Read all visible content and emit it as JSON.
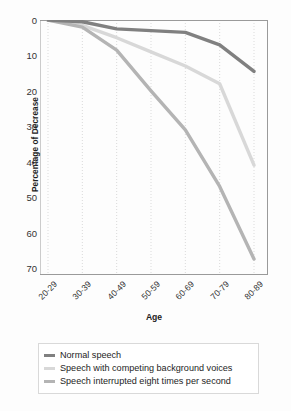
{
  "chart_data": {
    "type": "line",
    "title": "",
    "xlabel": "Age",
    "ylabel": "Percentage of Decrease",
    "categories": [
      "20-29",
      "30-39",
      "40-49",
      "50-59",
      "60-69",
      "70-79",
      "80-89"
    ],
    "ylim": [
      0,
      72
    ],
    "y_inverted": true,
    "yticks": [
      0,
      10,
      20,
      30,
      40,
      50,
      60,
      70
    ],
    "grid": "vertical-dotted",
    "legend_position": "below-axes",
    "series": [
      {
        "name": "Normal speech",
        "color": "#808080",
        "values": [
          0,
          0.5,
          2.5,
          3.0,
          3.5,
          7.0,
          14.5
        ]
      },
      {
        "name": "Speech with competing background voices",
        "color": "#d8d8d8",
        "values": [
          0,
          1.5,
          5.0,
          9.0,
          13.0,
          18.0,
          41.0
        ]
      },
      {
        "name": "Speech interrupted eight times per second",
        "color": "#b4b4b4",
        "values": [
          0,
          2.0,
          8.5,
          20.0,
          31.0,
          47.0,
          67.5
        ]
      }
    ]
  },
  "axes": {
    "ylabel": "Percentage of Decrease",
    "xlabel": "Age",
    "ytick_labels": [
      "0",
      "10",
      "20",
      "30",
      "40",
      "50",
      "60",
      "70"
    ],
    "xtick_labels": [
      "20-29",
      "30-39",
      "40-49",
      "50-59",
      "60-69",
      "70-79",
      "80-89"
    ]
  },
  "legend": {
    "items": [
      {
        "label": "Normal speech",
        "color": "#808080"
      },
      {
        "label": "Speech with competing background voices",
        "color": "#d8d8d8"
      },
      {
        "label": "Speech interrupted eight times per second",
        "color": "#b4b4b4"
      }
    ]
  },
  "colors": {
    "background": "#fdfdfd",
    "axis": "#9a9a9a",
    "grid": "#cccccc",
    "text": "#242424"
  }
}
